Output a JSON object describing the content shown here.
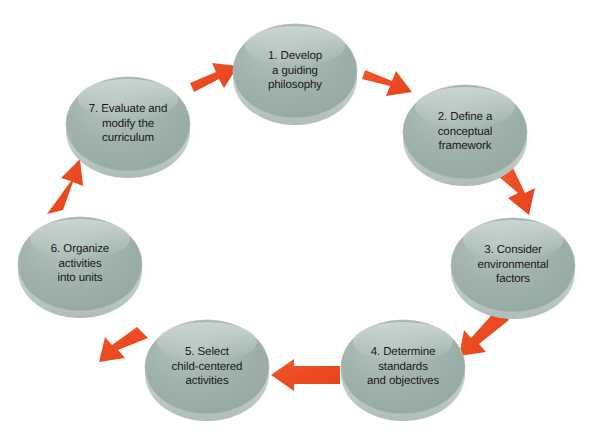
{
  "diagram": {
    "type": "cyclical-process",
    "direction": "clockwise",
    "background_color": "#ffffff",
    "node_fill_color": "#9dafa9",
    "node_highlight_color": "#c3d0cb",
    "node_rim_color": "#b9c7c2",
    "node_shadow_color": "#c8cdc9",
    "arrow_color": "#ee4a22",
    "text_color": "#1a1a1a",
    "nodes": [
      {
        "id": "node-1",
        "number": "1",
        "label": "1. Develop\na guiding\nphilosophy",
        "cx": 295,
        "cy": 71,
        "rx": 62,
        "ry": 47
      },
      {
        "id": "node-2",
        "number": "2",
        "label": "2. Define a\nconceptual\nframework",
        "cx": 465,
        "cy": 132,
        "rx": 62,
        "ry": 47
      },
      {
        "id": "node-3",
        "number": "3",
        "label": "3. Consider\nenvironmental\nfactors",
        "cx": 513,
        "cy": 265,
        "rx": 62,
        "ry": 47
      },
      {
        "id": "node-4",
        "number": "4",
        "label": "4. Determine\nstandards\nand objectives",
        "cx": 403,
        "cy": 367,
        "rx": 62,
        "ry": 47
      },
      {
        "id": "node-5",
        "number": "5",
        "label": "5. Select\nchild-centered\nactivities",
        "cx": 207,
        "cy": 367,
        "rx": 62,
        "ry": 47
      },
      {
        "id": "node-6",
        "number": "6",
        "label": "6. Organize\nactivities\ninto units",
        "cx": 80,
        "cy": 264,
        "rx": 62,
        "ry": 47
      },
      {
        "id": "node-7",
        "number": "7",
        "label": "7. Evaluate and\nmodify the\ncurriculum",
        "cx": 128,
        "cy": 124,
        "rx": 62,
        "ry": 47
      }
    ],
    "arrows": [
      {
        "id": "arrow-7-to-1",
        "from": "node-7",
        "to": "node-1",
        "label": "arrow from step 7 to step 1"
      },
      {
        "id": "arrow-1-to-2",
        "from": "node-1",
        "to": "node-2",
        "label": "arrow from step 1 to step 2"
      },
      {
        "id": "arrow-2-to-3",
        "from": "node-2",
        "to": "node-3",
        "label": "arrow from step 2 to step 3"
      },
      {
        "id": "arrow-3-to-4",
        "from": "node-3",
        "to": "node-4",
        "label": "arrow from step 3 to step 4"
      },
      {
        "id": "arrow-4-to-5",
        "from": "node-4",
        "to": "node-5",
        "label": "arrow from step 4 to step 5"
      },
      {
        "id": "arrow-5-to-6",
        "from": "node-5",
        "to": "node-6",
        "label": "arrow from step 5 to step 6"
      },
      {
        "id": "arrow-6-to-7",
        "from": "node-6",
        "to": "node-7",
        "label": "arrow from step 6 to step 7"
      }
    ]
  }
}
